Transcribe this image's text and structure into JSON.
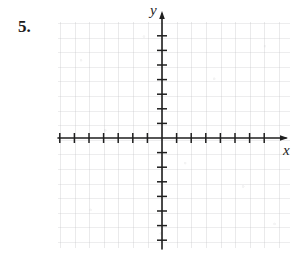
{
  "worksheet": {
    "problem_number": "5.",
    "instruction_text": ""
  },
  "axis_labels": {
    "x": "x",
    "y": "y"
  },
  "colors": {
    "background": "#ffffff",
    "axis": "#1f1f1f",
    "problem_number": "#1c1c1c",
    "grid_faint": "#787880"
  },
  "chart_data": {
    "type": "scatter",
    "title": "",
    "subtitle": "",
    "xlabel": "x",
    "ylabel": "y",
    "series": [
      {
        "name": "",
        "x": [],
        "y": []
      }
    ],
    "x": [],
    "values": [],
    "xlim": [
      -7,
      8
    ],
    "ylim": [
      -7,
      8
    ],
    "x_ticks": [
      -7,
      -6,
      -5,
      -4,
      -3,
      -2,
      -1,
      1,
      2,
      3,
      4,
      5,
      6,
      7
    ],
    "y_ticks": [
      -7,
      -6,
      -5,
      -4,
      -3,
      -2,
      -1,
      1,
      2,
      3,
      4,
      5,
      6,
      7
    ],
    "x_tick_labels": [],
    "y_tick_labels": [],
    "x_tick_count_left": 7,
    "x_tick_count_right": 7,
    "y_tick_count_above": 7,
    "y_tick_count_below": 7,
    "grid": true,
    "grid_style": "faint-square-grid",
    "legend": false,
    "legend_position": "none",
    "annotations": [],
    "axis_arrows": [
      "x-positive",
      "y-positive"
    ],
    "note": "Empty coordinate plane provided for student graphing; no data plotted."
  },
  "geometry": {
    "origin_x": 162,
    "origin_y": 138,
    "unit_px": 14.6,
    "x_axis_start": 58,
    "x_axis_end": 288,
    "y_axis_start": 12,
    "y_axis_end": 249,
    "tick_half_length": 5
  }
}
